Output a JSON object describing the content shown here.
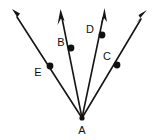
{
  "figure": {
    "type": "geometry-diagram",
    "background_color": "#ffffff",
    "stroke_color": "#151515",
    "label_color": "#101010",
    "canvas": {
      "width": 160,
      "height": 140
    },
    "vertex": {
      "name": "A",
      "label": "A",
      "x": 82,
      "y": 118,
      "label_x": 82,
      "label_y": 131
    },
    "rays": [
      {
        "id": "ray-AE",
        "label_through": "E",
        "from_x": 82,
        "from_y": 118,
        "to_x": 13,
        "to_y": 11,
        "point": {
          "label": "E",
          "x": 50,
          "y": 66,
          "label_x": 38,
          "label_y": 73
        }
      },
      {
        "id": "ray-AB",
        "label_through": "B",
        "from_x": 82,
        "from_y": 118,
        "to_x": 61,
        "to_y": 11,
        "point": {
          "label": "B",
          "x": 71,
          "y": 48,
          "label_x": 61,
          "label_y": 43
        }
      },
      {
        "id": "ray-AD",
        "label_through": "D",
        "from_x": 82,
        "from_y": 118,
        "to_x": 104,
        "to_y": 10,
        "point": {
          "label": "D",
          "x": 102,
          "y": 35,
          "label_x": 90,
          "label_y": 30
        }
      },
      {
        "id": "ray-AC",
        "label_through": "C",
        "from_x": 82,
        "from_y": 118,
        "to_x": 146,
        "to_y": 12,
        "point": {
          "label": "C",
          "x": 117,
          "y": 65,
          "label_x": 107,
          "label_y": 57
        }
      }
    ]
  }
}
